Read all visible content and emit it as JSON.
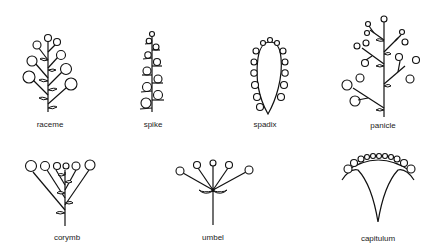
{
  "figures": [
    {
      "id": "raceme",
      "label": "raceme"
    },
    {
      "id": "spike",
      "label": "spike"
    },
    {
      "id": "spadix",
      "label": "spadix"
    },
    {
      "id": "panicle",
      "label": "panicle"
    },
    {
      "id": "corymb",
      "label": "corymb"
    },
    {
      "id": "umbel",
      "label": "umbel"
    },
    {
      "id": "capitulum",
      "label": "capitulum"
    }
  ],
  "colors": {
    "line": "#111111",
    "background": "#ffffff",
    "label": "#222222"
  }
}
